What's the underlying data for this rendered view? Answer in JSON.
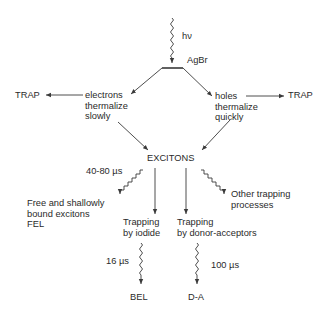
{
  "diagram": {
    "photon_label": "hν",
    "crystal_label": "AgBr",
    "left_trap": "TRAP",
    "right_trap": "TRAP",
    "electrons": [
      "electrons",
      "thermalize",
      "slowly"
    ],
    "holes": [
      "holes",
      "thermalize",
      "quickly"
    ],
    "center": "EXCITONS",
    "fel_time": "40-80 µs",
    "fel": [
      "Free and shallowly",
      "bound excitons",
      "FEL"
    ],
    "iodide": [
      "Trapping",
      "by iodide"
    ],
    "donor": [
      "Trapping",
      "by donor-acceptors"
    ],
    "other": [
      "Other trapping",
      "processes"
    ],
    "bel_time": "16 µs",
    "da_time": "100 µs",
    "bel": "BEL",
    "da": "D-A"
  },
  "colors": {
    "line": "#3a3a3a",
    "text": "#2a2a2a"
  }
}
